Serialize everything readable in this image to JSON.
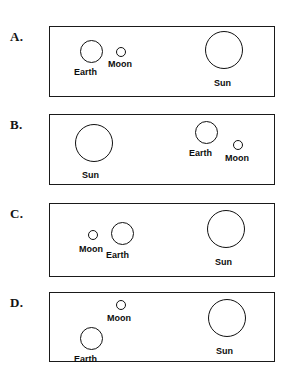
{
  "figure": {
    "width": 295,
    "height": 378,
    "background_color": "#ffffff",
    "stroke_color": "#111111",
    "text_color": "#0d0d0d"
  },
  "panels": [
    {
      "letter": "A.",
      "letter_x": 10,
      "letter_y": 30,
      "box": {
        "x": 49,
        "y": 26,
        "w": 226,
        "h": 71
      },
      "bodies": [
        {
          "name": "Earth",
          "cx": 91,
          "cy": 51,
          "d": 23,
          "label": "Earth",
          "label_x": 74,
          "label_y": 68
        },
        {
          "name": "Moon",
          "cx": 121,
          "cy": 52,
          "d": 10,
          "label": "Moon",
          "label_x": 108,
          "label_y": 60
        },
        {
          "name": "Sun",
          "cx": 224,
          "cy": 50,
          "d": 38,
          "label": "Sun",
          "label_x": 214,
          "label_y": 79
        }
      ]
    },
    {
      "letter": "B.",
      "letter_x": 10,
      "letter_y": 118,
      "box": {
        "x": 49,
        "y": 114,
        "w": 226,
        "h": 71
      },
      "bodies": [
        {
          "name": "Sun",
          "cx": 94,
          "cy": 143,
          "d": 38,
          "label": "Sun",
          "label_x": 82,
          "label_y": 171
        },
        {
          "name": "Earth",
          "cx": 206,
          "cy": 132,
          "d": 23,
          "label": "Earth",
          "label_x": 189,
          "label_y": 149
        },
        {
          "name": "Moon",
          "cx": 238,
          "cy": 145,
          "d": 10,
          "label": "Moon",
          "label_x": 225,
          "label_y": 154
        }
      ]
    },
    {
      "letter": "C.",
      "letter_x": 10,
      "letter_y": 207,
      "box": {
        "x": 49,
        "y": 203,
        "w": 226,
        "h": 74
      },
      "bodies": [
        {
          "name": "Moon",
          "cx": 93,
          "cy": 235,
          "d": 10,
          "label": "Moon",
          "label_x": 79,
          "label_y": 245
        },
        {
          "name": "Earth",
          "cx": 122,
          "cy": 233,
          "d": 23,
          "label": "Earth",
          "label_x": 106,
          "label_y": 251
        },
        {
          "name": "Sun",
          "cx": 226,
          "cy": 229,
          "d": 38,
          "label": "Sun",
          "label_x": 215,
          "label_y": 258
        }
      ]
    },
    {
      "letter": "D.",
      "letter_x": 10,
      "letter_y": 296,
      "box": {
        "x": 49,
        "y": 292,
        "w": 226,
        "h": 70
      },
      "bodies": [
        {
          "name": "Moon",
          "cx": 121,
          "cy": 305,
          "d": 10,
          "label": "Moon",
          "label_x": 107,
          "label_y": 314
        },
        {
          "name": "Earth",
          "cx": 91,
          "cy": 338,
          "d": 23,
          "label": "Earth",
          "label_x": 74,
          "label_y": 355
        },
        {
          "name": "Sun",
          "cx": 227,
          "cy": 318,
          "d": 38,
          "label": "Sun",
          "label_x": 216,
          "label_y": 347
        }
      ]
    }
  ]
}
